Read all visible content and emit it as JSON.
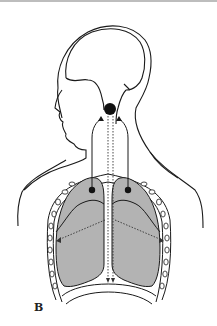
{
  "figure": {
    "panel_label": "B",
    "elements": {
      "brain_outline": "head with brain contour",
      "brainstem_node": "black dot at brainstem",
      "lungs": [
        "left lung (shaded grey)",
        "right lung (shaded grey)"
      ],
      "lung_nodes": [
        "black dot on left lung apex",
        "black dot on right lung apex"
      ],
      "ribcage": "chain of rib segments around thorax",
      "pathways": {
        "solid_arrows": "from lungs up to brainstem",
        "dotted_arrows_down": "from brainstem down to diaphragm",
        "dotted_arrows_lateral": "from midline to chest wall"
      }
    },
    "colors": {
      "line": "#1a1a1a",
      "lung_fill": "#b3b3b3",
      "background": "#ffffff"
    }
  }
}
